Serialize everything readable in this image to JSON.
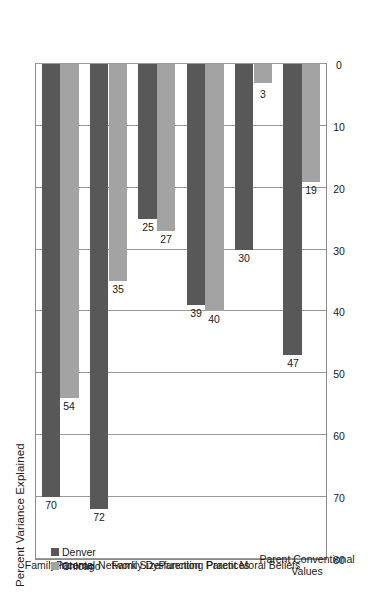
{
  "chart_data": {
    "type": "bar",
    "orientation": "horizontal",
    "title": "Percent Variance Explained",
    "xlabel": "",
    "ylabel": "",
    "xlim": [
      0,
      80
    ],
    "ticks": [
      "0",
      "10",
      "20",
      "30",
      "40",
      "50",
      "60",
      "70",
      "80"
    ],
    "grid": true,
    "legend_position": "top-left",
    "categories": [
      "Family Income",
      "Parental Network Size",
      "Family Dysfunction",
      "Parenting Practices",
      "Parent Moral Beliefs",
      "Parent Conventional\nValues"
    ],
    "series": [
      {
        "name": "Denver",
        "color": "#585858",
        "values": [
          70,
          72,
          25,
          39,
          30,
          47
        ],
        "labels": [
          "70",
          "72",
          "25",
          "39",
          "30",
          "47"
        ]
      },
      {
        "name": "Chicago",
        "color": "#a3a3a3",
        "values": [
          54,
          35,
          27,
          40,
          3,
          19
        ],
        "labels": [
          "54",
          "35",
          "27",
          "40",
          "3",
          "19"
        ]
      }
    ]
  },
  "legend": {
    "items": [
      {
        "label": "Denver",
        "color": "#585858"
      },
      {
        "label": "Chicago",
        "color": "#a3a3a3"
      }
    ]
  },
  "colors": {
    "denver": "#585858",
    "chicago": "#a3a3a3",
    "gridline": "#9a9a9a",
    "axis": "#8a8a8a",
    "background": "#ffffff",
    "text": "#1a1a1a"
  }
}
